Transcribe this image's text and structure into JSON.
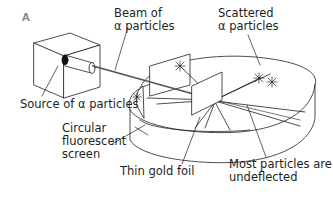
{
  "figure": {
    "panel_label": "A"
  },
  "labels": {
    "beam_line1": "Beam of",
    "beam_line2": "α particles",
    "scattered_line1": "Scattered",
    "scattered_line2": "α particles",
    "source": "Source of α particles",
    "screen_line1": "Circular",
    "screen_line2": "fluorescent",
    "screen_line3": "screen",
    "foil": "Thin gold foil",
    "undeflected_line1": "Most particles are",
    "undeflected_line2": "undeflected"
  },
  "colors": {
    "line": "#231f20",
    "text": "#231f20",
    "panel_label": "#8a8a8a",
    "background": "#ffffff"
  }
}
